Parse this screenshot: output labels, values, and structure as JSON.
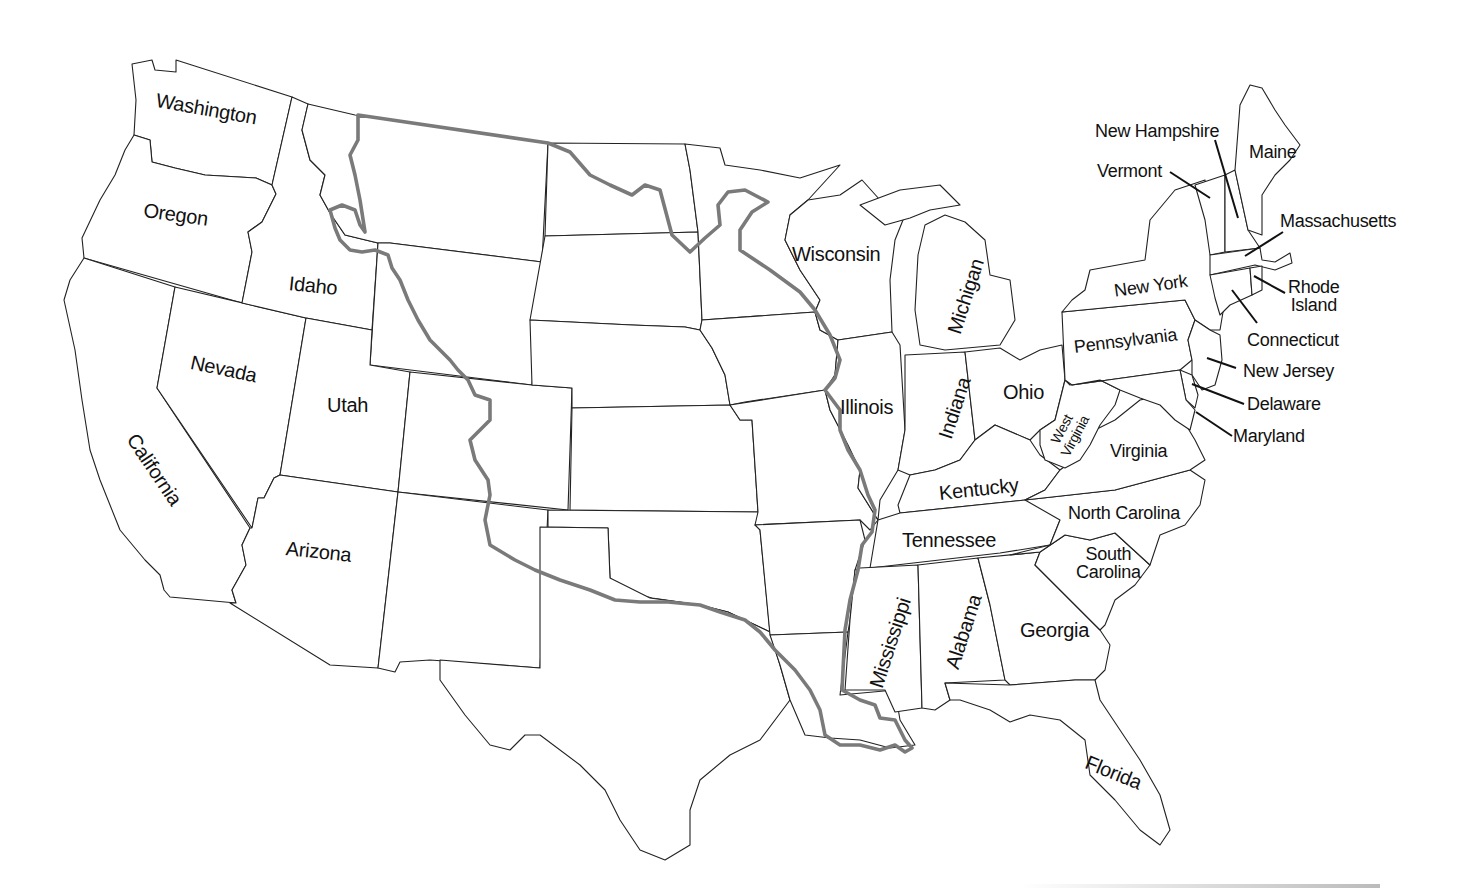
{
  "map": {
    "title": "United States outline map",
    "boundary_color": "#7a7a7a",
    "state_stroke": "#222222",
    "background": "#ffffff",
    "boundary_feature": "Louisiana Purchase boundary (gray line)"
  },
  "labels": {
    "washington": "Washington",
    "oregon": "Oregon",
    "idaho": "Idaho",
    "nevada": "Nevada",
    "california": "California",
    "utah": "Utah",
    "arizona": "Arizona",
    "wisconsin": "Wisconsin",
    "michigan": "Michigan",
    "illinois": "Illinois",
    "indiana": "Indiana",
    "ohio": "Ohio",
    "west_virginia_1": "West",
    "west_virginia_2": "Virginia",
    "virginia": "Virginia",
    "kentucky": "Kentucky",
    "tennessee": "Tennessee",
    "north_carolina": "North Carolina",
    "south_carolina_1": "South",
    "south_carolina_2": "Carolina",
    "georgia": "Georgia",
    "alabama": "Alabama",
    "mississippi": "Mississippi",
    "florida": "Florida",
    "new_york": "New York",
    "pennsylvania": "Pennsylvania",
    "new_hampshire": "New Hampshire",
    "vermont": "Vermont",
    "maine": "Maine",
    "massachusetts": "Massachusetts",
    "rhode_island_1": "Rhode",
    "rhode_island_2": "Island",
    "connecticut": "Connecticut",
    "new_jersey": "New Jersey",
    "delaware": "Delaware",
    "maryland": "Maryland"
  }
}
